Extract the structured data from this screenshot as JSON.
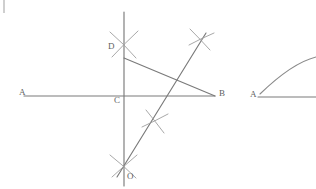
{
  "figure": {
    "background_color": "#ffffff",
    "line_color": "#7a7a7a",
    "arc_color": "#9e9e9e",
    "label_color": "#5f5f5f",
    "width": 316,
    "height": 189,
    "corner_tick": {
      "name": "page-edge-tick",
      "color": "#cfcfcf"
    },
    "labels": {
      "a_left": "A",
      "b_right": "B",
      "c_center": "C",
      "d_top": "D",
      "o_bottom": "O",
      "a_right_figure": "A"
    },
    "left_construction": {
      "horizontal_line": {
        "name": "line-AB",
        "from": [
          24,
          96
        ],
        "to": [
          215,
          96
        ]
      },
      "vertical_line": {
        "name": "line-DO-vertical",
        "from": [
          124,
          12
        ],
        "to": [
          124,
          186
        ]
      },
      "diagonal_line": {
        "name": "line-O-to-upper-right",
        "from": [
          118,
          176
        ],
        "to": [
          206,
          33
        ]
      },
      "segment_DB": {
        "name": "segment-DB",
        "from": [
          124,
          58
        ],
        "to": [
          215,
          96
        ]
      },
      "points": {
        "A": [
          24,
          96
        ],
        "B": [
          215,
          96
        ],
        "C": [
          124,
          96
        ],
        "D": [
          124,
          58
        ],
        "O": [
          124,
          176
        ]
      },
      "compass_marks": [
        {
          "name": "arc-cross-at-D",
          "center": [
            124,
            42
          ]
        },
        {
          "name": "arc-cross-at-upper-right",
          "center": [
            200,
            38
          ]
        },
        {
          "name": "arc-cross-mid-diagonal",
          "center": [
            155,
            121
          ]
        },
        {
          "name": "arc-cross-at-O",
          "center": [
            124,
            166
          ]
        }
      ]
    },
    "right_construction": {
      "ray": {
        "name": "ray-A-horizontal",
        "from": [
          258,
          97
        ],
        "to": [
          316,
          97
        ]
      },
      "arc": {
        "name": "construction-arc-from-A",
        "from": [
          259,
          94
        ],
        "control": [
          295,
          62
        ],
        "to": [
          316,
          58
        ]
      },
      "vertex": [
        258,
        97
      ]
    }
  }
}
